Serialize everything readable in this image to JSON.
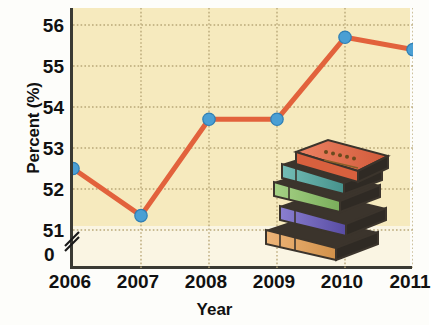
{
  "chart_data": {
    "type": "line",
    "title": "",
    "xlabel": "Year",
    "ylabel": "Percent (%)",
    "categories": [
      "2006",
      "2007",
      "2008",
      "2009",
      "2010",
      "2011"
    ],
    "x": [
      2006,
      2007,
      2008,
      2009,
      2010,
      2011
    ],
    "values": [
      52.5,
      51.35,
      53.7,
      53.7,
      55.7,
      55.4
    ],
    "series": [
      {
        "name": "Percent",
        "values": [
          52.5,
          51.35,
          53.7,
          53.7,
          55.7,
          55.4
        ]
      }
    ],
    "ylim": [
      51,
      56
    ],
    "yticks": [
      51,
      52,
      53,
      54,
      55,
      56
    ],
    "ytick_labels": [
      "51",
      "52",
      "53",
      "54",
      "55",
      "56"
    ],
    "zero_label": "0",
    "axis_break": true,
    "xticks": [
      2006,
      2007,
      2008,
      2009,
      2010,
      2011
    ],
    "grid": true,
    "grid_style": "dotted",
    "legend": "none",
    "line_color": "#e2623c",
    "marker_color": "#4a9fd4",
    "marker_edge_color": "#2f7fb5",
    "plot_background": "#f6eabe",
    "axis_color": "#3a3a33",
    "grid_color": "#b9a878"
  },
  "decoration": {
    "name": "stack-of-books",
    "book_count": 5,
    "book_colors": [
      "#e3714f",
      "#5aa9a4",
      "#8cc06a",
      "#6f63b8",
      "#e0a059"
    ],
    "cover_edge_color": "#3b342c"
  }
}
